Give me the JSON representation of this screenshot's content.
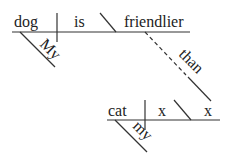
{
  "diagram": {
    "type": "sentence-diagram",
    "main_clause": {
      "subject": "dog",
      "verb": "is",
      "predicate_adjective": "friendlier",
      "subject_modifier": "My"
    },
    "comparative_connector": "than",
    "sub_clause": {
      "subject": "cat",
      "verb": "x",
      "complement": "x",
      "subject_modifier": "my"
    }
  }
}
